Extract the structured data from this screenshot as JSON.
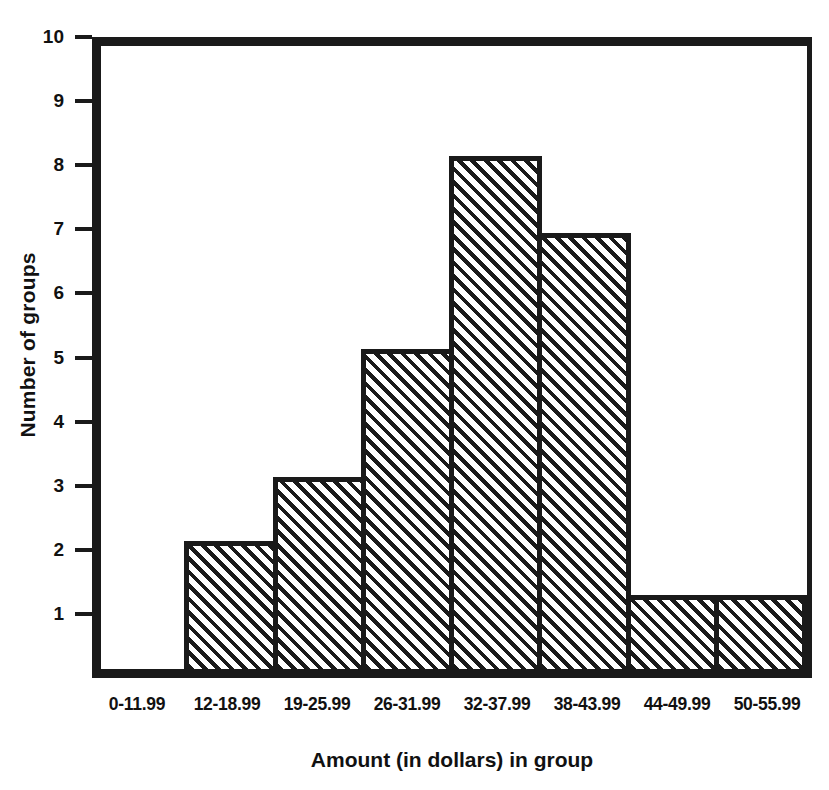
{
  "chart_data": {
    "type": "bar",
    "title": "",
    "subtitle": "",
    "xlabel": "Amount (in dollars) in group",
    "ylabel": "Number of groups",
    "categories": [
      "0-11.99",
      "12-18.99",
      "19-25.99",
      "26-31.99",
      "32-37.99",
      "38-43.99",
      "44-49.99",
      "50-55.99"
    ],
    "values": [
      0,
      2,
      3,
      5,
      8,
      6.8,
      1.15,
      1.15
    ],
    "ylim": [
      0,
      10
    ],
    "yticks": [
      1,
      2,
      3,
      4,
      5,
      6,
      7,
      8,
      9,
      10
    ],
    "ytick_labels": [
      "1",
      "2",
      "3",
      "4",
      "5",
      "6",
      "7",
      "8",
      "9",
      "10"
    ],
    "grid": false,
    "legend": null,
    "legend_position": "none",
    "bar_fill": "diagonal-hatch",
    "bar_edge_color": "#1a1a1a",
    "background_color": "#ffffff",
    "annotations": []
  }
}
